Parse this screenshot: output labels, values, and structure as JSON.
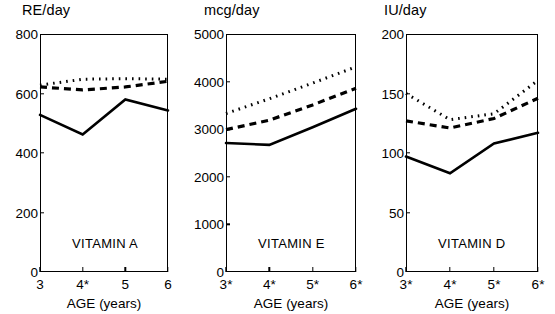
{
  "figure": {
    "axis_title": "AGE (years)",
    "line_color": "#000000"
  },
  "chart_data": [
    {
      "type": "line",
      "title": "VITAMIN A",
      "ylabel": "RE/day",
      "xlabel": "AGE (years)",
      "categories": [
        "3",
        "4*",
        "5",
        "6"
      ],
      "x": [
        3,
        4,
        5,
        6
      ],
      "ylim": [
        0,
        800
      ],
      "yticks": [
        0,
        200,
        400,
        600,
        800
      ],
      "grid": false,
      "legend": "none",
      "series": [
        {
          "name": "solid",
          "style": "solid",
          "values": [
            528,
            462,
            580,
            543
          ]
        },
        {
          "name": "dashed",
          "style": "dashed",
          "values": [
            622,
            612,
            622,
            641
          ]
        },
        {
          "name": "dotted",
          "style": "dotted",
          "values": [
            628,
            648,
            650,
            648
          ]
        }
      ]
    },
    {
      "type": "line",
      "title": "VITAMIN E",
      "ylabel": "mcg/day",
      "xlabel": "AGE (years)",
      "categories": [
        "3*",
        "4*",
        "5*",
        "6*"
      ],
      "x": [
        3,
        4,
        5,
        6
      ],
      "ylim": [
        0,
        5000
      ],
      "yticks": [
        0,
        1000,
        2000,
        3000,
        4000,
        5000
      ],
      "grid": false,
      "legend": "none",
      "series": [
        {
          "name": "solid",
          "style": "solid",
          "values": [
            2710,
            2670,
            3040,
            3430
          ]
        },
        {
          "name": "dashed",
          "style": "dashed",
          "values": [
            2990,
            3190,
            3510,
            3860
          ]
        },
        {
          "name": "dotted",
          "style": "dotted",
          "values": [
            3330,
            3640,
            3970,
            4310
          ]
        }
      ]
    },
    {
      "type": "line",
      "title": "VITAMIN D",
      "ylabel": "IU/day",
      "xlabel": "AGE (years)",
      "categories": [
        "3*",
        "4*",
        "5*",
        "6*"
      ],
      "x": [
        3,
        4,
        5,
        6
      ],
      "ylim": [
        0,
        200
      ],
      "yticks": [
        0,
        50,
        100,
        150,
        200
      ],
      "grid": false,
      "legend": "none",
      "series": [
        {
          "name": "solid",
          "style": "solid",
          "values": [
            97,
            83,
            108,
            117
          ]
        },
        {
          "name": "dashed",
          "style": "dashed",
          "values": [
            127,
            121,
            129,
            146
          ]
        },
        {
          "name": "dotted",
          "style": "dotted",
          "values": [
            150,
            128,
            133,
            161
          ]
        }
      ]
    }
  ]
}
